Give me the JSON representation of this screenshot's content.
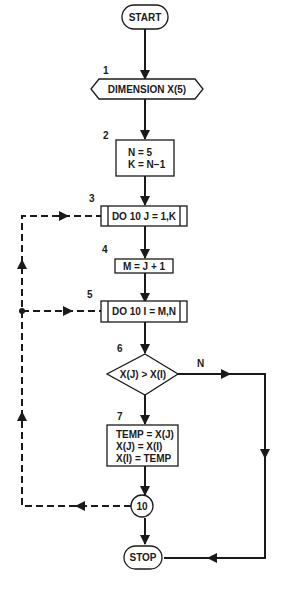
{
  "flowchart": {
    "start": {
      "label": "START"
    },
    "steps": [
      {
        "number": "1",
        "type": "preparation",
        "lines": [
          "DIMENSION X(5)"
        ]
      },
      {
        "number": "2",
        "type": "process",
        "lines": [
          "N = 5",
          "K = N−1"
        ]
      },
      {
        "number": "3",
        "type": "loop",
        "lines": [
          "DO 10 J = 1,K"
        ]
      },
      {
        "number": "4",
        "type": "process",
        "lines": [
          "M = J + 1"
        ]
      },
      {
        "number": "5",
        "type": "loop",
        "lines": [
          "DO 10 I = M,N"
        ]
      },
      {
        "number": "6",
        "type": "decision",
        "lines": [
          "X(J) > X(I)"
        ],
        "branch_label": "N"
      },
      {
        "number": "7",
        "type": "process",
        "lines": [
          "TEMP = X(J)",
          "X(J) = X(I)",
          "X(I) = TEMP"
        ]
      }
    ],
    "connector": {
      "label": "10"
    },
    "stop": {
      "label": "STOP"
    }
  }
}
